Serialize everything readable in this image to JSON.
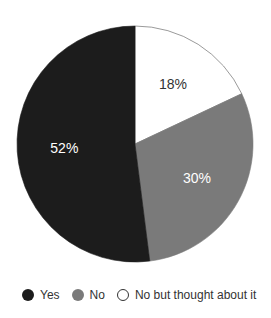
{
  "chart_data": {
    "type": "pie",
    "title": "",
    "categories": [
      "Yes",
      "No",
      "No but thought about it"
    ],
    "values": [
      52,
      30,
      18
    ],
    "labels": [
      "52%",
      "30%",
      "18%"
    ],
    "colors": [
      "#1c1c1c",
      "#7a7a7a",
      "#ffffff"
    ],
    "legend_position": "bottom"
  },
  "legend": [
    {
      "label": "Yes",
      "color": "#1c1c1c"
    },
    {
      "label": "No",
      "color": "#7a7a7a"
    },
    {
      "label": "No but thought about it",
      "color": "#ffffff"
    }
  ]
}
